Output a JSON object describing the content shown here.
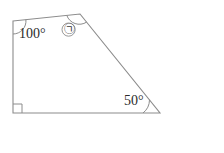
{
  "figure": {
    "name": "quadrilateral-angle-problem",
    "shape_type": "quadrilateral",
    "stroke_color": "#8c8c8c",
    "fill_color": "none",
    "vertices": [
      {
        "id": "top-left",
        "x": 13,
        "y": 21
      },
      {
        "id": "top-right",
        "x": 80,
        "y": 14
      },
      {
        "id": "bottom-right",
        "x": 160,
        "y": 113
      },
      {
        "id": "bottom-left",
        "x": 13,
        "y": 113
      }
    ],
    "angles": [
      {
        "at": "top-left",
        "label": "100°",
        "marker": "arc"
      },
      {
        "at": "top-right",
        "label": "㉠",
        "marker": "arc"
      },
      {
        "at": "bottom-right",
        "label": "50°",
        "marker": "arc"
      },
      {
        "at": "bottom-left",
        "label": "",
        "marker": "right-angle-square"
      }
    ]
  },
  "labels": {
    "angle_100": "100°",
    "angle_50": "50°",
    "unknown_angle": "㉠"
  },
  "answer": {
    "open_paren": "(",
    "close_paren": ")",
    "unit": "도",
    "value": ""
  }
}
